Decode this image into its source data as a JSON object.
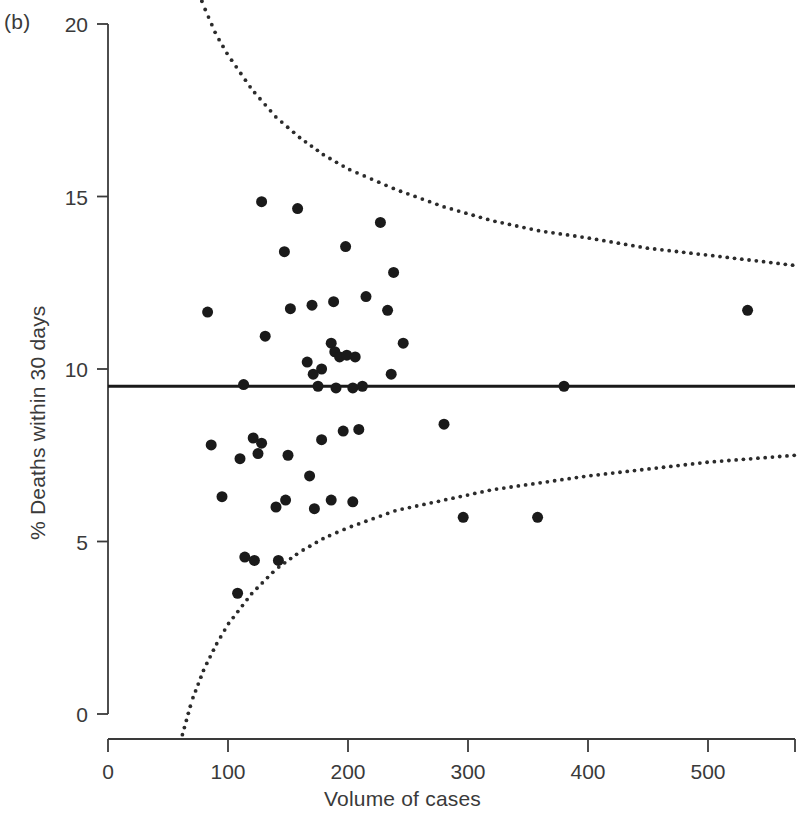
{
  "panel": {
    "label": "(b)"
  },
  "chart_data": {
    "type": "scatter",
    "title": "",
    "xlabel": "Volume of cases",
    "ylabel": "% Deaths within 30 days",
    "xlim": [
      0,
      573
    ],
    "ylim": [
      0,
      20
    ],
    "xticks": [
      0,
      100,
      200,
      300,
      400,
      500
    ],
    "xtick_labels": [
      "0",
      "100",
      "200",
      "300",
      "400",
      "500"
    ],
    "yticks": [
      0,
      5,
      10,
      15,
      20
    ],
    "ytick_labels": [
      "0",
      "5",
      "10",
      "15",
      "20"
    ],
    "grid": false,
    "legend": null,
    "marker_color": "#1a1a1a",
    "marker_size": 11,
    "reference_line": {
      "label": "overall mortality",
      "value": 9.5,
      "style": "solid",
      "color": "#1a1a1a"
    },
    "control_limits": {
      "label": "95% control limits",
      "style": "dotted",
      "color": "#2b2b2b",
      "center": 9.5,
      "spread_constant": 66,
      "upper": [
        {
          "x": 70,
          "y": 21.4
        },
        {
          "x": 80,
          "y": 20.5
        },
        {
          "x": 90,
          "y": 19.7
        },
        {
          "x": 100,
          "y": 19.1
        },
        {
          "x": 120,
          "y": 18.1
        },
        {
          "x": 140,
          "y": 17.3
        },
        {
          "x": 160,
          "y": 16.7
        },
        {
          "x": 180,
          "y": 16.2
        },
        {
          "x": 200,
          "y": 15.8
        },
        {
          "x": 240,
          "y": 15.2
        },
        {
          "x": 280,
          "y": 14.7
        },
        {
          "x": 320,
          "y": 14.3
        },
        {
          "x": 360,
          "y": 14.0
        },
        {
          "x": 400,
          "y": 13.8
        },
        {
          "x": 450,
          "y": 13.5
        },
        {
          "x": 500,
          "y": 13.3
        },
        {
          "x": 573,
          "y": 13.0
        }
      ],
      "lower": [
        {
          "x": 62,
          "y": -0.6
        },
        {
          "x": 70,
          "y": 0.4
        },
        {
          "x": 80,
          "y": 1.3
        },
        {
          "x": 90,
          "y": 2.0
        },
        {
          "x": 100,
          "y": 2.6
        },
        {
          "x": 120,
          "y": 3.5
        },
        {
          "x": 140,
          "y": 4.2
        },
        {
          "x": 160,
          "y": 4.7
        },
        {
          "x": 180,
          "y": 5.1
        },
        {
          "x": 200,
          "y": 5.4
        },
        {
          "x": 240,
          "y": 5.9
        },
        {
          "x": 280,
          "y": 6.2
        },
        {
          "x": 320,
          "y": 6.5
        },
        {
          "x": 360,
          "y": 6.7
        },
        {
          "x": 400,
          "y": 6.9
        },
        {
          "x": 450,
          "y": 7.1
        },
        {
          "x": 500,
          "y": 7.3
        },
        {
          "x": 573,
          "y": 7.5
        }
      ]
    },
    "points": [
      {
        "x": 128,
        "y": 14.85
      },
      {
        "x": 158,
        "y": 14.65
      },
      {
        "x": 227,
        "y": 14.25
      },
      {
        "x": 147,
        "y": 13.4
      },
      {
        "x": 198,
        "y": 13.55
      },
      {
        "x": 238,
        "y": 12.8
      },
      {
        "x": 215,
        "y": 12.1
      },
      {
        "x": 170,
        "y": 11.85
      },
      {
        "x": 188,
        "y": 11.95
      },
      {
        "x": 152,
        "y": 11.75
      },
      {
        "x": 233,
        "y": 11.7
      },
      {
        "x": 83,
        "y": 11.65
      },
      {
        "x": 533,
        "y": 11.7
      },
      {
        "x": 131,
        "y": 10.95
      },
      {
        "x": 186,
        "y": 10.75
      },
      {
        "x": 189,
        "y": 10.5
      },
      {
        "x": 193,
        "y": 10.35
      },
      {
        "x": 246,
        "y": 10.75
      },
      {
        "x": 166,
        "y": 10.2
      },
      {
        "x": 178,
        "y": 10.0
      },
      {
        "x": 171,
        "y": 9.85
      },
      {
        "x": 199,
        "y": 10.4
      },
      {
        "x": 206,
        "y": 10.35
      },
      {
        "x": 236,
        "y": 9.85
      },
      {
        "x": 113,
        "y": 9.55
      },
      {
        "x": 175,
        "y": 9.5
      },
      {
        "x": 190,
        "y": 9.45
      },
      {
        "x": 204,
        "y": 9.45
      },
      {
        "x": 212,
        "y": 9.5
      },
      {
        "x": 380,
        "y": 9.5
      },
      {
        "x": 280,
        "y": 8.4
      },
      {
        "x": 196,
        "y": 8.2
      },
      {
        "x": 209,
        "y": 8.25
      },
      {
        "x": 121,
        "y": 8.0
      },
      {
        "x": 128,
        "y": 7.85
      },
      {
        "x": 178,
        "y": 7.95
      },
      {
        "x": 86,
        "y": 7.8
      },
      {
        "x": 125,
        "y": 7.55
      },
      {
        "x": 150,
        "y": 7.5
      },
      {
        "x": 110,
        "y": 7.4
      },
      {
        "x": 168,
        "y": 6.9
      },
      {
        "x": 95,
        "y": 6.3
      },
      {
        "x": 148,
        "y": 6.2
      },
      {
        "x": 186,
        "y": 6.2
      },
      {
        "x": 204,
        "y": 6.15
      },
      {
        "x": 172,
        "y": 5.95
      },
      {
        "x": 140,
        "y": 6.0
      },
      {
        "x": 296,
        "y": 5.7
      },
      {
        "x": 358,
        "y": 5.7
      },
      {
        "x": 114,
        "y": 4.55
      },
      {
        "x": 122,
        "y": 4.45
      },
      {
        "x": 142,
        "y": 4.45
      },
      {
        "x": 108,
        "y": 3.5
      }
    ]
  }
}
